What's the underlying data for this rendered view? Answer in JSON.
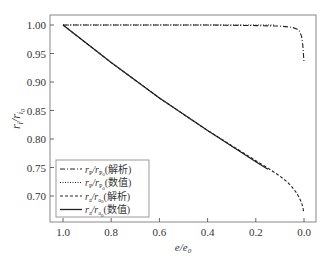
{
  "chart_data": {
    "type": "line",
    "title": "",
    "xlabel": "e/e₀",
    "ylabel": "rᵢ/rᵢ₀",
    "xlim": [
      1.05,
      -0.05
    ],
    "ylim": [
      0.655,
      1.015
    ],
    "x_reversed": true,
    "grid": false,
    "legend_position": "lower left",
    "xticks": [
      1.0,
      0.8,
      0.6,
      0.4,
      0.2,
      0.0
    ],
    "xtick_labels": [
      "1.0",
      "0.8",
      "0.6",
      "0.4",
      "0.2",
      "0.0"
    ],
    "yticks": [
      1.0,
      0.95,
      0.9,
      0.85,
      0.8,
      0.75,
      0.7
    ],
    "ytick_labels": [
      "1.00",
      "0.95",
      "0.90",
      "0.85",
      "0.80",
      "0.75",
      "0.70"
    ],
    "series": [
      {
        "name": "rp/rp0(解析)",
        "label_main": "r",
        "label_sub1": "P",
        "label_mid": "/r",
        "label_sub2": "P",
        "label_sub3": "0",
        "label_suffix": "(解析)",
        "style": "dashdot",
        "x": [
          1.0,
          0.8,
          0.6,
          0.4,
          0.2,
          0.1,
          0.05,
          0.03,
          0.02,
          0.01,
          0.005,
          0.0
        ],
        "y": [
          1.0,
          1.0,
          1.0,
          1.0,
          0.999,
          0.998,
          0.996,
          0.993,
          0.99,
          0.98,
          0.965,
          0.935
        ]
      },
      {
        "name": "rp/rp0(数值)",
        "label_main": "r",
        "label_sub1": "P",
        "label_mid": "/r",
        "label_sub2": "P",
        "label_sub3": "0",
        "label_suffix": "(数值)",
        "style": "dotted",
        "x": [
          1.0,
          0.8,
          0.6,
          0.4,
          0.2,
          0.12
        ],
        "y": [
          1.0,
          1.0,
          1.0,
          1.0,
          1.0,
          1.0
        ]
      },
      {
        "name": "ra/ra0(解析)",
        "label_main": "r",
        "label_sub1": "a",
        "label_mid": "/r",
        "label_sub2": "a",
        "label_sub3": "0",
        "label_suffix": "(解析)",
        "style": "dashed",
        "x": [
          1.0,
          0.8,
          0.6,
          0.4,
          0.2,
          0.15,
          0.1,
          0.07,
          0.05,
          0.03,
          0.02,
          0.01,
          0.005,
          0.0
        ],
        "y": [
          1.0,
          0.934,
          0.872,
          0.815,
          0.762,
          0.749,
          0.735,
          0.725,
          0.716,
          0.705,
          0.697,
          0.688,
          0.68,
          0.67
        ]
      },
      {
        "name": "ra/ra0(数值)",
        "label_main": "r",
        "label_sub1": "a",
        "label_mid": "/r",
        "label_sub2": "a",
        "label_sub3": "0",
        "label_suffix": "(数值)",
        "style": "solid",
        "x": [
          1.0,
          0.8,
          0.6,
          0.4,
          0.2,
          0.15
        ],
        "y": [
          1.0,
          0.934,
          0.872,
          0.815,
          0.76,
          0.747
        ]
      }
    ]
  }
}
